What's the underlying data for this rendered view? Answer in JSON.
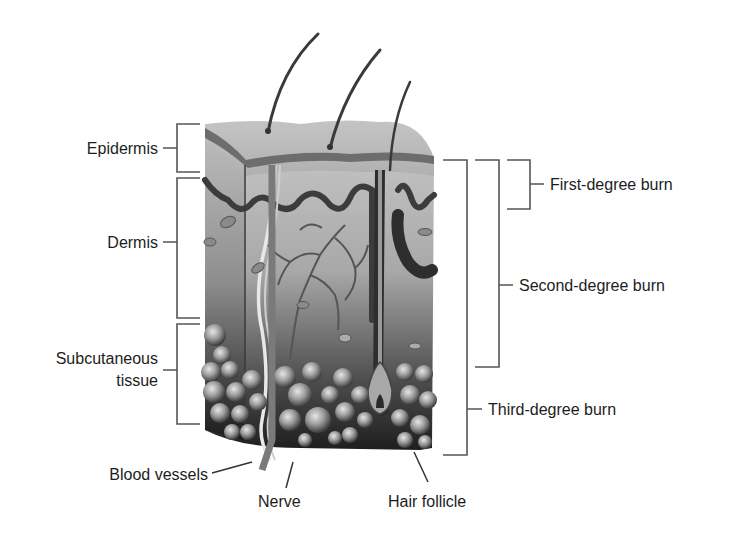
{
  "diagram": {
    "layer_labels": {
      "epidermis": "Epidermis",
      "dermis": "Dermis",
      "subcutaneous_line1": "Subcutaneous",
      "subcutaneous_line2": "tissue"
    },
    "structure_labels": {
      "blood_vessels": "Blood vessels",
      "nerve": "Nerve",
      "hair_follicle": "Hair follicle"
    },
    "burn_labels": {
      "first": "First-degree burn",
      "second": "Second-degree burn",
      "third": "Third-degree burn"
    },
    "colors": {
      "text": "#1d1d1d",
      "bracket": "#555555",
      "epidermis": "#b9b9b9",
      "dermis": "#9a9a9a",
      "fat": "#8c8c8c",
      "dark": "#2a2a2a"
    }
  }
}
